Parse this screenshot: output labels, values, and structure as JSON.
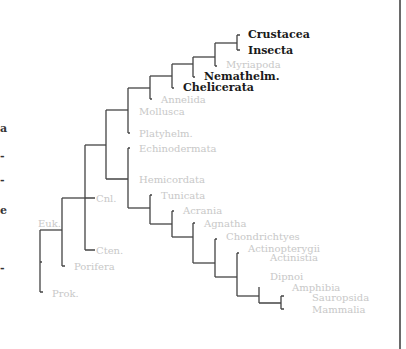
{
  "figure": {
    "line_color": "#444444",
    "label_color_dim": "#c8c8c8",
    "label_color_highlight": "#1a1a1a"
  },
  "left_fragments": [
    "a",
    "-",
    "-",
    "e",
    "-"
  ],
  "taxa": {
    "crustacea": "Crustacea",
    "insecta": "Insecta",
    "myriapoda": "Myriapoda",
    "nemathelm": "Nemathelm.",
    "chelicerata": "Chelicerata",
    "annelida": "Annelida",
    "mollusca": "Mollusca",
    "platyhelm": "Platyhelm.",
    "echinodermata": "Echinodermata",
    "hemicordata": "Hemicordata",
    "tunicata": "Tunicata",
    "acrania": "Acrania",
    "agnatha": "Agnatha",
    "chondrichtyes": "Chondrichtyes",
    "actinopterygii": "Actinopterygii",
    "actinistia": "Actinistia",
    "dipnoi": "Dipnoi",
    "amphibia": "Amphibia",
    "sauropsida": "Sauropsida",
    "mammalia": "Mammalia",
    "cnl": "Cnl.",
    "cten": "Cten.",
    "euk": "Euk.",
    "porifera": "Porifera",
    "prok": "Prok."
  },
  "highlighted": [
    "Crustacea",
    "Insecta",
    "Nemathelm.",
    "Chelicerata"
  ]
}
